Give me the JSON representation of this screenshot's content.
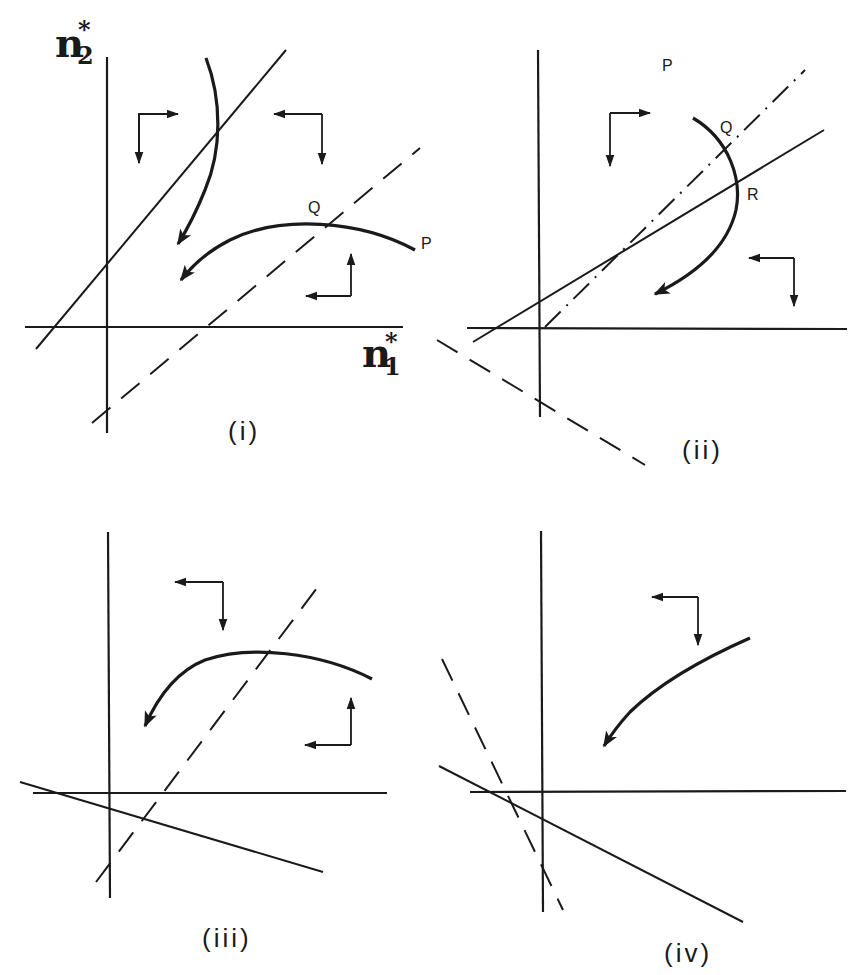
{
  "figure": {
    "axes": {
      "y_label_base": "n",
      "y_label_sup": "*",
      "y_label_sub": "2",
      "x_label_base": "n",
      "x_label_sup": "*",
      "x_label_sub": "1"
    },
    "panels": [
      {
        "id": "i",
        "label": "(i)",
        "points": [
          "Q",
          "P"
        ],
        "isoclines": [
          "solid line, positive slope",
          "dashed line, positive slope"
        ],
        "trajectories": 2
      },
      {
        "id": "ii",
        "label": "(ii)",
        "points": [
          "P",
          "Q",
          "R"
        ],
        "isoclines": [
          "solid line, positive slope",
          "dash-dot line, positive slope",
          "dashed line, negative slope"
        ],
        "trajectories": 1
      },
      {
        "id": "iii",
        "label": "(iii)",
        "points": [],
        "isoclines": [
          "solid line, negative slope",
          "dashed line, positive slope"
        ],
        "trajectories": 1
      },
      {
        "id": "iv",
        "label": "(iv)",
        "points": [],
        "isoclines": [
          "solid line, negative slope",
          "dashed line, negative slope"
        ],
        "trajectories": 1
      }
    ]
  }
}
